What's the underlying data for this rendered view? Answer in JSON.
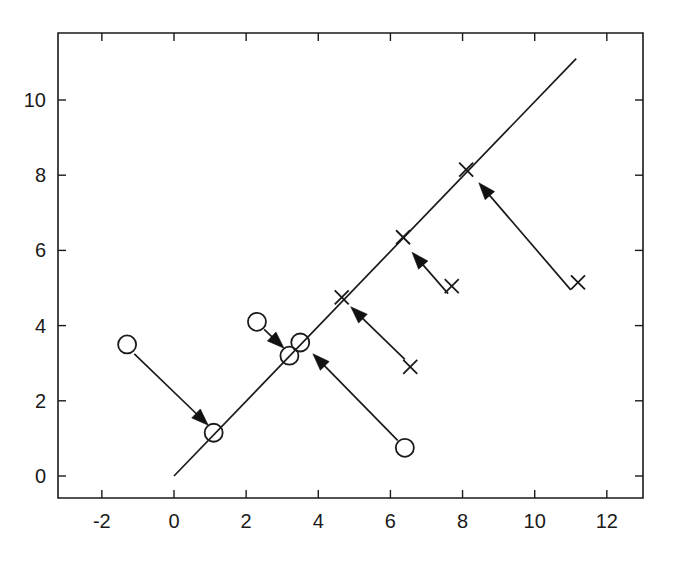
{
  "chart_data": {
    "type": "scatter",
    "title": "",
    "subtitle": "",
    "xlabel": "",
    "ylabel": "",
    "xlim": [
      -3.0,
      13.0
    ],
    "ylim": [
      -1.2,
      11.8
    ],
    "grid": false,
    "legend": null,
    "xticks": [
      -2,
      0,
      2,
      4,
      6,
      8,
      10,
      12
    ],
    "xtick_labels": [
      "-2",
      "0",
      "2",
      "4",
      "6",
      "8",
      "10",
      "12"
    ],
    "yticks": [
      0,
      2,
      4,
      6,
      8,
      10
    ],
    "ytick_labels": [
      "0",
      "2",
      "4",
      "6",
      "8",
      "10"
    ],
    "line": {
      "name": "projection-axis",
      "x": [
        0.0,
        11.15
      ],
      "y": [
        0.0,
        11.1
      ],
      "slope": 1.0,
      "intercept": 0.0
    },
    "series": [
      {
        "name": "class-circle-sources",
        "marker": "circle",
        "points": [
          {
            "x": -1.3,
            "y": 3.5
          },
          {
            "x": 2.3,
            "y": 4.1
          },
          {
            "x": 6.4,
            "y": 0.75
          }
        ]
      },
      {
        "name": "class-circle-projections",
        "marker": "circle",
        "points": [
          {
            "x": 1.1,
            "y": 1.15
          },
          {
            "x": 3.2,
            "y": 3.2
          },
          {
            "x": 3.5,
            "y": 3.55
          }
        ]
      },
      {
        "name": "class-cross-sources",
        "marker": "cross",
        "points": [
          {
            "x": 6.55,
            "y": 2.9
          },
          {
            "x": 7.7,
            "y": 5.05
          },
          {
            "x": 11.2,
            "y": 5.15
          }
        ]
      },
      {
        "name": "class-cross-projections",
        "marker": "cross",
        "points": [
          {
            "x": 4.65,
            "y": 4.75
          },
          {
            "x": 6.35,
            "y": 6.35
          },
          {
            "x": 8.1,
            "y": 8.15
          }
        ]
      }
    ],
    "arrows": [
      {
        "name": "arrow-circle-1",
        "from": {
          "x": -1.1,
          "y": 3.25
        },
        "to": {
          "x": 0.95,
          "y": 1.35
        }
      },
      {
        "name": "arrow-circle-2",
        "from": {
          "x": 2.5,
          "y": 3.9
        },
        "to": {
          "x": 3.05,
          "y": 3.4
        }
      },
      {
        "name": "arrow-circle-3",
        "from": {
          "x": 6.2,
          "y": 0.95
        },
        "to": {
          "x": 3.85,
          "y": 3.25
        }
      },
      {
        "name": "arrow-cross-1",
        "from": {
          "x": 6.4,
          "y": 3.1
        },
        "to": {
          "x": 4.9,
          "y": 4.5
        }
      },
      {
        "name": "arrow-cross-2",
        "from": {
          "x": 7.6,
          "y": 4.85
        },
        "to": {
          "x": 6.6,
          "y": 5.95
        }
      },
      {
        "name": "arrow-cross-3",
        "from": {
          "x": 11.0,
          "y": 4.95
        },
        "to": {
          "x": 8.45,
          "y": 7.8
        }
      }
    ],
    "colors": {
      "foreground": "#1a1a1a",
      "background": "#ffffff",
      "marker": "#1a1a1a",
      "arrow": "#111111"
    },
    "marker_sizes": {
      "circle_radius": 9,
      "cross_half": 7
    },
    "axes_pixels": {
      "left": 58,
      "right": 643,
      "top": 33,
      "bottom": 498,
      "x_origin_px": 174,
      "y_origin_px": 476,
      "px_per_x_unit": 36.07,
      "px_per_y_unit": 37.6
    }
  }
}
